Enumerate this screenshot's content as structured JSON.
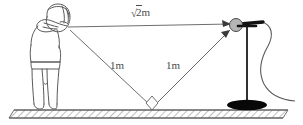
{
  "figure": {
    "type": "physics-diagram",
    "labels": {
      "hypotenuse": {
        "radical": "√",
        "radicand": "2",
        "unit": "m",
        "full": "√2m"
      },
      "incident": "1m",
      "reflected": "1m"
    },
    "annotations": {
      "right_angle_marker": "right-angle-marker"
    },
    "elements": {
      "person": "person-shouting",
      "microphone": "microphone-on-stand",
      "ground": "hatched-ground-strip",
      "cable": "microphone-cable"
    },
    "colors": {
      "outline": "#5a5a5a",
      "line": "#6e6e6e",
      "text": "#4a4a4a",
      "mic_head": "#b5b5b5",
      "mic_boom": "#111111",
      "mic_base": "#080808",
      "stand": "#1a1a1a",
      "ground_fill": "#f2f2f2",
      "hatch": "#8a8a8a",
      "background": "#ffffff"
    },
    "geometry": {
      "mouth": [
        68,
        27
      ],
      "bounce": [
        152,
        108
      ],
      "microphone": [
        236,
        25
      ],
      "ground_y": 110
    }
  }
}
